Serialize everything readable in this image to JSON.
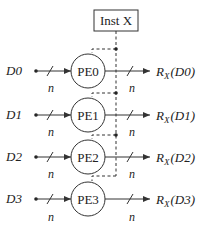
{
  "diagram": {
    "type": "simd-processing-array",
    "instruction_box": {
      "label": "Inst X"
    },
    "width_label": "n",
    "rows": [
      {
        "input": "D0",
        "pe": "PE0",
        "output_prefix": "R",
        "output_sub": "X",
        "output_arg": "(D0)"
      },
      {
        "input": "D1",
        "pe": "PE1",
        "output_prefix": "R",
        "output_sub": "X",
        "output_arg": "(D1)"
      },
      {
        "input": "D2",
        "pe": "PE2",
        "output_prefix": "R",
        "output_sub": "X",
        "output_arg": "(D2)"
      },
      {
        "input": "D3",
        "pe": "PE3",
        "output_prefix": "R",
        "output_sub": "X",
        "output_arg": "(D3)"
      }
    ],
    "colors": {
      "stroke": "#333333",
      "text": "#222222",
      "background": "#ffffff"
    }
  }
}
